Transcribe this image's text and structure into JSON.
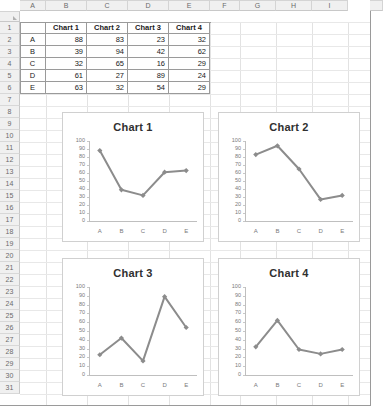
{
  "spreadsheet": {
    "column_headers": [
      "A",
      "B",
      "C",
      "D",
      "E",
      "F",
      "G",
      "H",
      "I"
    ],
    "row_headers": [
      "1",
      "2",
      "3",
      "4",
      "5",
      "6",
      "7",
      "8",
      "9",
      "10",
      "11",
      "12",
      "13",
      "14",
      "15",
      "16",
      "17",
      "18",
      "19",
      "20",
      "21",
      "22",
      "23",
      "24",
      "25",
      "26",
      "27",
      "28",
      "29",
      "30",
      "31"
    ],
    "table": {
      "corner_cell": "",
      "headers": [
        "Chart 1",
        "Chart 2",
        "Chart 3",
        "Chart 4"
      ],
      "row_labels": [
        "A",
        "B",
        "C",
        "D",
        "E"
      ],
      "rows": [
        {
          "label": "A",
          "values": [
            88,
            83,
            23,
            32
          ]
        },
        {
          "label": "B",
          "values": [
            39,
            94,
            42,
            62
          ]
        },
        {
          "label": "C",
          "values": [
            32,
            65,
            16,
            29
          ]
        },
        {
          "label": "D",
          "values": [
            61,
            27,
            89,
            24
          ]
        },
        {
          "label": "E",
          "values": [
            63,
            32,
            54,
            29
          ]
        }
      ]
    }
  },
  "colors": {
    "series_line": "#8c8c8c",
    "axis": "#bfbfbf",
    "chart_border": "#d0d0d0",
    "grid": "#e2e2e2",
    "header_fill": "#f0f0f0",
    "table_border": "#9a9a9a",
    "text": "#1a1a1a"
  },
  "chart_data": [
    {
      "type": "line",
      "title": "Chart 1",
      "categories": [
        "A",
        "B",
        "C",
        "D",
        "E"
      ],
      "values": [
        88,
        39,
        32,
        61,
        63
      ],
      "xlabel": "",
      "ylabel": "",
      "ylim": [
        0,
        100
      ],
      "ytick_values": [
        100,
        90,
        80,
        70,
        60,
        50,
        40,
        30,
        20,
        10,
        0
      ],
      "grid": false,
      "legend": "none",
      "marker": "diamond"
    },
    {
      "type": "line",
      "title": "Chart 2",
      "categories": [
        "A",
        "B",
        "C",
        "D",
        "E"
      ],
      "values": [
        83,
        94,
        65,
        27,
        32
      ],
      "xlabel": "",
      "ylabel": "",
      "ylim": [
        0,
        100
      ],
      "ytick_values": [
        100,
        90,
        80,
        70,
        60,
        50,
        40,
        30,
        20,
        10,
        0
      ],
      "grid": false,
      "legend": "none",
      "marker": "diamond"
    },
    {
      "type": "line",
      "title": "Chart 3",
      "categories": [
        "A",
        "B",
        "C",
        "D",
        "E"
      ],
      "values": [
        23,
        42,
        16,
        89,
        54
      ],
      "xlabel": "",
      "ylabel": "",
      "ylim": [
        0,
        100
      ],
      "ytick_values": [
        100,
        90,
        80,
        70,
        60,
        50,
        40,
        30,
        20,
        10,
        0
      ],
      "grid": false,
      "legend": "none",
      "marker": "diamond"
    },
    {
      "type": "line",
      "title": "Chart 4",
      "categories": [
        "A",
        "B",
        "C",
        "D",
        "E"
      ],
      "values": [
        32,
        62,
        29,
        24,
        29
      ],
      "xlabel": "",
      "ylabel": "",
      "ylim": [
        0,
        100
      ],
      "ytick_values": [
        100,
        90,
        80,
        70,
        60,
        50,
        40,
        30,
        20,
        10,
        0
      ],
      "grid": false,
      "legend": "none",
      "marker": "diamond"
    }
  ]
}
